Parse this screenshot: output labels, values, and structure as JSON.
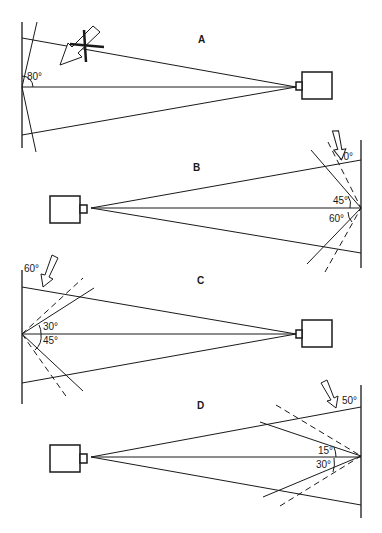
{
  "panels": {
    "A": {
      "label": "A",
      "angle_labels": [
        "80°"
      ]
    },
    "B": {
      "label": "B",
      "angle_labels": [
        "70°",
        "45°",
        "60°"
      ]
    },
    "C": {
      "label": "C",
      "angle_labels": [
        "60°",
        "30°",
        "45°"
      ]
    },
    "D": {
      "label": "D",
      "angle_labels": [
        "50°",
        "15°",
        "30°"
      ]
    }
  },
  "colors": {
    "ink": "#1a1a1a",
    "background": "#ffffff"
  }
}
